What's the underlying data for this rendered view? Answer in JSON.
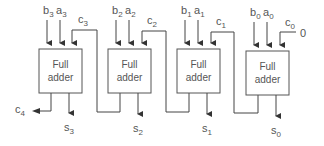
{
  "diagram": {
    "adders": [
      {
        "line1": "Full",
        "line2": "adder",
        "b": "b",
        "b_sub": "3",
        "a": "a",
        "a_sub": "3",
        "cin": "c",
        "cin_sub": "3",
        "s": "s",
        "s_sub": "3"
      },
      {
        "line1": "Full",
        "line2": "adder",
        "b": "b",
        "b_sub": "2",
        "a": "a",
        "a_sub": "2",
        "cin": "c",
        "cin_sub": "2",
        "s": "s",
        "s_sub": "2"
      },
      {
        "line1": "Full",
        "line2": "adder",
        "b": "b",
        "b_sub": "1",
        "a": "a",
        "a_sub": "1",
        "cin": "c",
        "cin_sub": "1",
        "s": "s",
        "s_sub": "1"
      },
      {
        "line1": "Full",
        "line2": "adder",
        "b": "b",
        "b_sub": "0",
        "a": "a",
        "a_sub": "0",
        "cin": "c",
        "cin_sub": "0",
        "s": "s",
        "s_sub": "0"
      }
    ],
    "carry_out": {
      "label": "c",
      "sub": "4"
    },
    "carry_in_value": "0",
    "colors": {
      "stroke": "#444444",
      "text": "#555555",
      "background": "#ffffff"
    }
  }
}
